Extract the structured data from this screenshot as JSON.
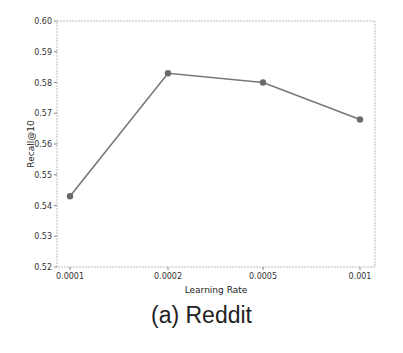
{
  "chart_data": {
    "type": "line",
    "title": "",
    "caption": "(a) Reddit",
    "xlabel": "Learning Rate",
    "ylabel": "Recall@10",
    "categories": [
      "0.0001",
      "0.0002",
      "0.0005",
      "0.001"
    ],
    "series": [
      {
        "name": "Recall@10",
        "values": [
          0.543,
          0.583,
          0.58,
          0.568
        ],
        "color": "#777777"
      }
    ],
    "ylim": [
      0.52,
      0.6
    ],
    "yticks": [
      "0.52",
      "0.53",
      "0.54",
      "0.55",
      "0.56",
      "0.57",
      "0.58",
      "0.59",
      "0.60"
    ],
    "grid": false,
    "legend": null
  }
}
